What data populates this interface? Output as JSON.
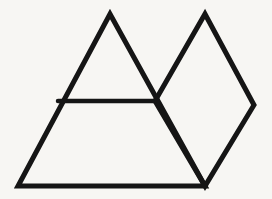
{
  "canvas": {
    "width": 272,
    "height": 199,
    "background_color": "#f7f6f3",
    "stroke_color": "#151515",
    "stroke_width": 5,
    "description": "Black line-drawing of overlapping geometric shapes: a large triangle divided by a horizontal line, overlapped on the right by a rhombus"
  },
  "shapes": {
    "big_triangle": {
      "name": "large-triangle",
      "points": "110,14 205,186 18,186",
      "apex": {
        "x": 110,
        "y": 14
      },
      "bottom_left": {
        "x": 18,
        "y": 186
      },
      "bottom_right": {
        "x": 205,
        "y": 186
      }
    },
    "divider_line": {
      "name": "horizontal-divider",
      "x1": 58,
      "y1": 101,
      "x2": 155,
      "y2": 101
    },
    "rhombus": {
      "name": "rhombus",
      "points": "205,14 254,105 205,186 155,101",
      "top": {
        "x": 205,
        "y": 14
      },
      "right": {
        "x": 254,
        "y": 105
      },
      "bottom": {
        "x": 205,
        "y": 186
      },
      "left": {
        "x": 155,
        "y": 101
      }
    }
  }
}
